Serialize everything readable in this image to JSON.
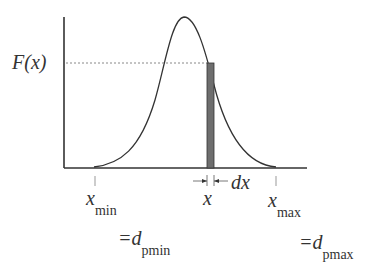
{
  "diagram": {
    "y_label": "F(x)",
    "x_symbol": "x",
    "dx_label": "dx",
    "xmin": {
      "symbol": "x",
      "sub": "min",
      "eq": "=d",
      "eq_sub": "pmin"
    },
    "xmax": {
      "symbol": "x",
      "sub": "max",
      "eq": "=d",
      "eq_sub": "pmax"
    },
    "colors": {
      "line": "#333333",
      "bar_fill": "#6e6e6e",
      "dashed": "#888888"
    }
  }
}
